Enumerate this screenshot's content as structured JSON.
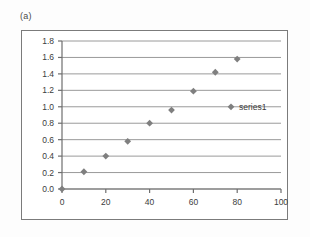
{
  "figure": {
    "panel_label": "(a)",
    "background_color": "#fdfdfd",
    "frame_color": "#7b7b7b"
  },
  "chart_data": {
    "type": "scatter",
    "title": "",
    "xlabel": "",
    "ylabel": "",
    "xlim": [
      0,
      100
    ],
    "ylim": [
      0.0,
      1.8
    ],
    "xticks": [
      0,
      20,
      40,
      60,
      80,
      100
    ],
    "xtick_labels": [
      "0",
      "20",
      "40",
      "60",
      "80",
      "100"
    ],
    "yticks": [
      0.0,
      0.2,
      0.4,
      0.6,
      0.8,
      1.0,
      1.2,
      1.4,
      1.6,
      1.8
    ],
    "ytick_labels": [
      "0.0",
      "0.2",
      "0.4",
      "0.6",
      "0.8",
      "1.0",
      "1.2",
      "1.4",
      "1.6",
      "1.8"
    ],
    "grid": "horizontal",
    "grid_color": "#9a9a9a",
    "legend_position": "right",
    "marker": "diamond",
    "marker_color": "#7f7f7f",
    "series": [
      {
        "name": "series1",
        "x": [
          0,
          10,
          20,
          30,
          40,
          50,
          60,
          70,
          80
        ],
        "values": [
          0.0,
          0.21,
          0.4,
          0.58,
          0.8,
          0.96,
          1.19,
          1.42,
          1.58
        ]
      }
    ]
  },
  "legend": {
    "entries": [
      {
        "label": "series1",
        "marker_color": "#7f7f7f"
      }
    ]
  }
}
